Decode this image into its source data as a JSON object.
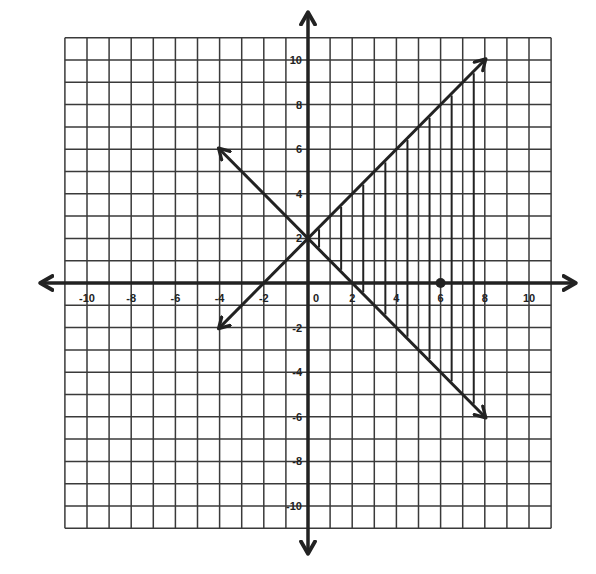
{
  "chart_data": {
    "type": "line",
    "title": "",
    "xlabel": "",
    "ylabel": "",
    "xlim": [
      -11,
      11
    ],
    "ylim": [
      -11,
      11
    ],
    "grid": true,
    "grid_step": 1,
    "x_tick_labels": [
      "-10",
      "-8",
      "-6",
      "-4",
      "-2",
      "0",
      "2",
      "4",
      "6",
      "8",
      "10"
    ],
    "y_tick_labels": [
      "10",
      "8",
      "6",
      "4",
      "2",
      "-2",
      "-4",
      "-6",
      "-8",
      "-10"
    ],
    "series": [
      {
        "name": "y = x + 2",
        "points": [
          [
            -4,
            -2
          ],
          [
            8,
            10
          ]
        ],
        "arrows": "both"
      },
      {
        "name": "y = -x + 2",
        "points": [
          [
            -4,
            6
          ],
          [
            8,
            -6
          ]
        ],
        "arrows": "both"
      }
    ],
    "shaded_region": {
      "description": "vertical hatch lines between the two lines for x > 0",
      "hatch_x": [
        0.5,
        1.5,
        2.5,
        3.5,
        4.5,
        5.5,
        6.5,
        7.5
      ]
    },
    "points": [
      {
        "x": 6,
        "y": 0
      }
    ]
  },
  "colors": {
    "grid": "#3a3a3a",
    "axis": "#222222",
    "line": "#222222",
    "background": "#ffffff"
  }
}
